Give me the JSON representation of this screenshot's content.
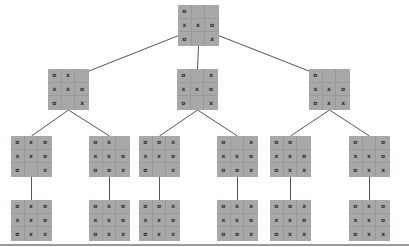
{
  "diagram": {
    "type": "game-tree",
    "game": "tic-tac-toe",
    "colors": {
      "board": "#a8a8a8",
      "grid": "#999999",
      "mark": "#333333",
      "edge": "#555555"
    },
    "nodes": [
      {
        "id": "root",
        "level": 1,
        "x": 178,
        "y": 5,
        "cells": [
          "o",
          "",
          "",
          "x",
          "x",
          "o",
          "o",
          "",
          "x"
        ]
      },
      {
        "id": "l2a",
        "level": 2,
        "x": 48,
        "y": 69,
        "cells": [
          "o",
          "x",
          "",
          "x",
          "x",
          "o",
          "o",
          "",
          "x"
        ]
      },
      {
        "id": "l2b",
        "level": 2,
        "x": 177,
        "y": 69,
        "cells": [
          "o",
          "",
          "x",
          "x",
          "x",
          "o",
          "o",
          "",
          "x"
        ]
      },
      {
        "id": "l2c",
        "level": 2,
        "x": 309,
        "y": 69,
        "cells": [
          "o",
          "",
          "",
          "x",
          "x",
          "o",
          "o",
          "x",
          "x"
        ]
      },
      {
        "id": "l3a",
        "level": 3,
        "x": 11,
        "y": 136,
        "cells": [
          "o",
          "x",
          "o",
          "x",
          "x",
          "o",
          "o",
          "",
          "x"
        ]
      },
      {
        "id": "l3b",
        "level": 3,
        "x": 89,
        "y": 136,
        "cells": [
          "o",
          "x",
          "",
          "x",
          "x",
          "o",
          "o",
          "o",
          "x"
        ]
      },
      {
        "id": "l3c",
        "level": 3,
        "x": 139,
        "y": 136,
        "cells": [
          "o",
          "o",
          "x",
          "x",
          "x",
          "o",
          "o",
          "",
          "x"
        ]
      },
      {
        "id": "l3d",
        "level": 3,
        "x": 217,
        "y": 136,
        "cells": [
          "o",
          "",
          "x",
          "x",
          "x",
          "o",
          "o",
          "o",
          "x"
        ]
      },
      {
        "id": "l3e",
        "level": 3,
        "x": 270,
        "y": 136,
        "cells": [
          "o",
          "o",
          "",
          "x",
          "x",
          "o",
          "o",
          "x",
          "x"
        ]
      },
      {
        "id": "l3f",
        "level": 3,
        "x": 349,
        "y": 136,
        "cells": [
          "o",
          "",
          "o",
          "x",
          "x",
          "o",
          "o",
          "x",
          "x"
        ]
      },
      {
        "id": "l4a",
        "level": 4,
        "x": 11,
        "y": 200,
        "cells": [
          "o",
          "x",
          "o",
          "x",
          "x",
          "o",
          "o",
          "x",
          "x"
        ]
      },
      {
        "id": "l4b",
        "level": 4,
        "x": 89,
        "y": 200,
        "cells": [
          "o",
          "x",
          "o",
          "x",
          "x",
          "o",
          "o",
          "x",
          "x"
        ]
      },
      {
        "id": "l4c",
        "level": 4,
        "x": 139,
        "y": 200,
        "cells": [
          "o",
          "o",
          "x",
          "x",
          "x",
          "o",
          "o",
          "x",
          "x"
        ]
      },
      {
        "id": "l4d",
        "level": 4,
        "x": 217,
        "y": 200,
        "cells": [
          "o",
          "x",
          "x",
          "x",
          "x",
          "o",
          "o",
          "o",
          "x"
        ]
      },
      {
        "id": "l4e",
        "level": 4,
        "x": 270,
        "y": 200,
        "cells": [
          "o",
          "o",
          "x",
          "x",
          "x",
          "o",
          "o",
          "x",
          "x"
        ]
      },
      {
        "id": "l4f",
        "level": 4,
        "x": 349,
        "y": 200,
        "cells": [
          "o",
          "x",
          "o",
          "x",
          "x",
          "o",
          "o",
          "x",
          "x"
        ]
      }
    ],
    "edges": [
      [
        "root",
        "l2a"
      ],
      [
        "root",
        "l2b"
      ],
      [
        "root",
        "l2c"
      ],
      [
        "l2a",
        "l3a"
      ],
      [
        "l2a",
        "l3b"
      ],
      [
        "l2b",
        "l3c"
      ],
      [
        "l2b",
        "l3d"
      ],
      [
        "l2c",
        "l3e"
      ],
      [
        "l2c",
        "l3f"
      ],
      [
        "l3a",
        "l4a"
      ],
      [
        "l3b",
        "l4b"
      ],
      [
        "l3c",
        "l4c"
      ],
      [
        "l3d",
        "l4d"
      ],
      [
        "l3e",
        "l4e"
      ],
      [
        "l3f",
        "l4f"
      ]
    ]
  }
}
